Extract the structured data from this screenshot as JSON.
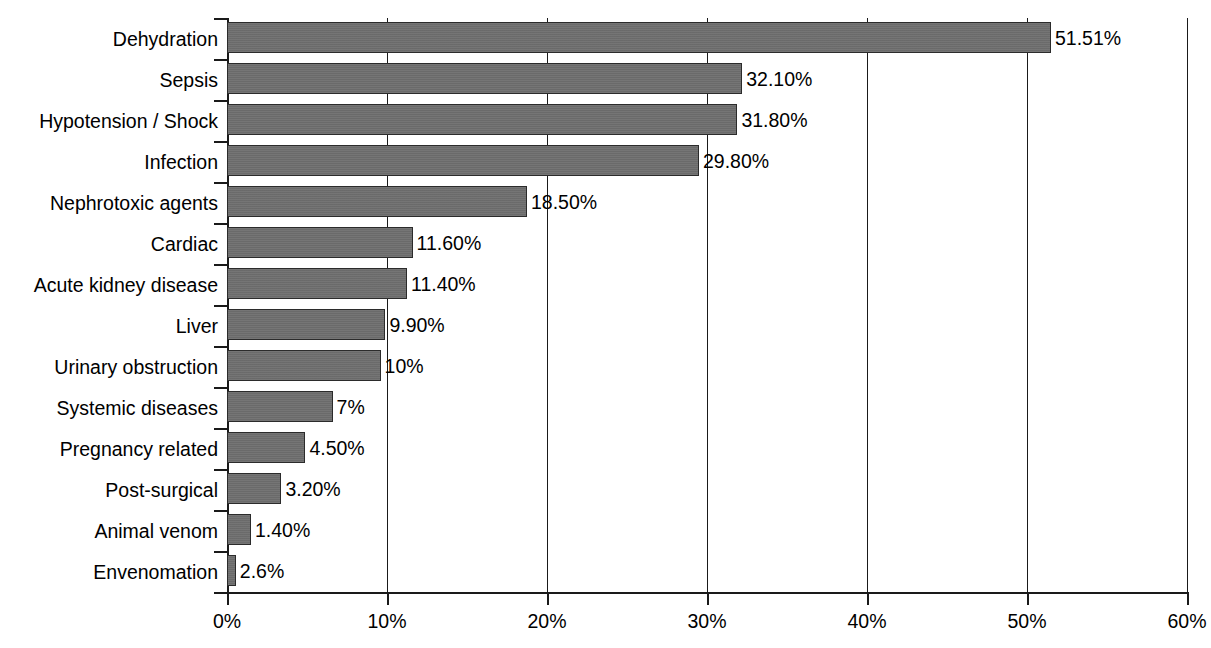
{
  "chart_data": {
    "type": "bar",
    "orientation": "horizontal",
    "title": "",
    "subtitle": "",
    "xlabel": "",
    "ylabel": "",
    "xlim": [
      0,
      60
    ],
    "xtick_step": 10,
    "grid": true,
    "gridlines_axis": "x",
    "legend": null,
    "bar_color": "#6f6f6f",
    "bar_border_color": "#2b2b2b",
    "axis_color": "#1a1a1a",
    "background": "#ffffff",
    "categories": [
      "Dehydration",
      "Sepsis",
      "Hypotension / Shock",
      "Infection",
      "Nephrotoxic agents",
      "Cardiac",
      "Acute kidney disease",
      "Liver",
      "Urinary obstruction",
      "Systemic diseases",
      "Pregnancy related",
      "Post-surgical",
      "Animal venom",
      "Envenomation"
    ],
    "values": [
      51.51,
      32.1,
      31.8,
      29.8,
      18.5,
      11.6,
      11.4,
      9.9,
      10,
      7,
      4.5,
      3.2,
      1.4,
      2.6
    ],
    "bar_lengths_percent": [
      51.5,
      32.2,
      31.9,
      29.5,
      18.75,
      11.6,
      11.25,
      9.9,
      9.6,
      6.6,
      4.9,
      3.4,
      1.5,
      0.55
    ],
    "data_labels": [
      "51.51%",
      "32.10%",
      "31.80%",
      "29.80%",
      "18.50%",
      "11.60%",
      "11.40%",
      "9.90%",
      "10%",
      "7%",
      "4.50%",
      "3.20%",
      "1.40%",
      "2.6%"
    ],
    "xtick_labels": [
      "0%",
      "10%",
      "20%",
      "30%",
      "40%",
      "50%",
      "60%"
    ],
    "xtick_values": [
      0,
      10,
      20,
      30,
      40,
      50,
      60
    ]
  }
}
